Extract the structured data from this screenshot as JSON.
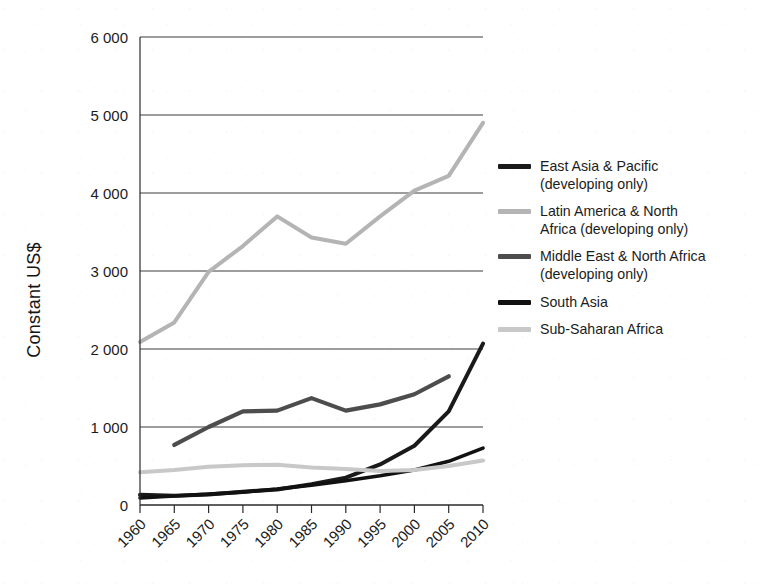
{
  "chart_data": {
    "type": "line",
    "title": "",
    "xlabel": "",
    "ylabel": "Constant US$",
    "xlim": [
      1960,
      2010
    ],
    "ylim": [
      0,
      6000
    ],
    "grid": true,
    "legend_position": "right",
    "x": [
      1960,
      1965,
      1970,
      1975,
      1980,
      1985,
      1990,
      1995,
      2000,
      2005,
      2010
    ],
    "xtick_labels": [
      "1960",
      "1965",
      "1970",
      "1975",
      "1980",
      "1985",
      "1990",
      "1995",
      "2000",
      "2005",
      "2010"
    ],
    "ytick_labels": [
      "0",
      "1 000",
      "2 000",
      "3 000",
      "4 000",
      "5 000",
      "6 000"
    ],
    "ytick_values": [
      0,
      1000,
      2000,
      3000,
      4000,
      5000,
      6000
    ],
    "series": [
      {
        "name": "East Asia & Pacific (developing only)",
        "color": "#1a1a1a",
        "width": 4.0,
        "x": [
          1960,
          1965,
          1970,
          1975,
          1980,
          1985,
          1990,
          1995,
          2000,
          2005,
          2010
        ],
        "values": [
          130,
          120,
          135,
          170,
          200,
          265,
          350,
          520,
          760,
          1200,
          2070
        ]
      },
      {
        "name": "Latin America & North Africa (developing only)",
        "color": "#b4b4b4",
        "width": 4.0,
        "x": [
          1960,
          1965,
          1970,
          1975,
          1980,
          1985,
          1990,
          1995,
          2000,
          2005,
          2010
        ],
        "values": [
          2090,
          2340,
          2990,
          3320,
          3700,
          3430,
          3350,
          3700,
          4030,
          4220,
          4900
        ]
      },
      {
        "name": "Middle East & North Africa (developing only)",
        "color": "#4d4d4d",
        "width": 4.2,
        "x": [
          1965,
          1970,
          1975,
          1980,
          1985,
          1990,
          1995,
          2000,
          2005
        ],
        "values": [
          770,
          1000,
          1200,
          1210,
          1370,
          1210,
          1290,
          1420,
          1650
        ]
      },
      {
        "name": "South Asia",
        "color": "#111111",
        "width": 3.6,
        "x": [
          1960,
          1965,
          1970,
          1975,
          1980,
          1985,
          1990,
          1995,
          2000,
          2005,
          2010
        ],
        "values": [
          90,
          115,
          140,
          165,
          205,
          255,
          310,
          375,
          450,
          560,
          730
        ]
      },
      {
        "name": "Sub-Saharan Africa",
        "color": "#c8c8c8",
        "width": 4.0,
        "x": [
          1960,
          1965,
          1970,
          1975,
          1980,
          1985,
          1990,
          1995,
          2000,
          2005,
          2010
        ],
        "values": [
          420,
          450,
          490,
          510,
          515,
          480,
          460,
          435,
          450,
          500,
          570
        ]
      }
    ]
  },
  "legend": {
    "entries": [
      {
        "label": "East Asia & Pacific\n(developing only)",
        "color": "#1a1a1a"
      },
      {
        "label": "Latin America & North\nAfrica (developing only)",
        "color": "#b4b4b4"
      },
      {
        "label": "Middle East & North Africa\n(developing only)",
        "color": "#4d4d4d"
      },
      {
        "label": "South Asia",
        "color": "#111111"
      },
      {
        "label": "Sub-Saharan Africa",
        "color": "#c8c8c8"
      }
    ]
  },
  "axes": {
    "y_title": "Constant US$",
    "grid_color": "#3c3c3c",
    "axis_color": "#2a2a2a"
  }
}
